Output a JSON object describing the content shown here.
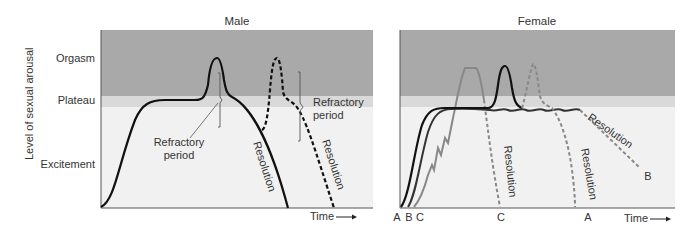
{
  "y_axis": {
    "title": "Level of sexual arousal",
    "levels": [
      "Orgasm",
      "Plateau",
      "Excitement"
    ]
  },
  "panels": [
    {
      "title": "Male",
      "annotations": [
        "Refractory\nperiod",
        "Refractory\nperiod",
        "Resolution",
        "Resolution"
      ],
      "refractory_label_1_line1": "Refractory",
      "refractory_label_1_line2": "period",
      "refractory_label_2_line1": "Refractory",
      "refractory_label_2_line2": "period",
      "resolution_1": "Resolution",
      "resolution_2": "Resolution",
      "x_label": "Time"
    },
    {
      "title": "Female",
      "curve_labels_start": [
        "A",
        "B",
        "C"
      ],
      "curve_label_c_end": "C",
      "curve_label_a_end": "A",
      "curve_label_b_end": "B",
      "resolution_c": "Resolution",
      "resolution_a": "Resolution",
      "resolution_b": "Resolution",
      "x_label": "Time"
    }
  ],
  "colors": {
    "orgasm_band": "#a9a9a9",
    "plateau_band": "#d9d9d9",
    "excitement_band": "#f1f1f1",
    "curve_dark": "#111111",
    "curve_gray": "#888888"
  }
}
